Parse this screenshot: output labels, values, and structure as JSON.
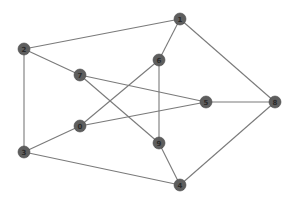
{
  "diagram": {
    "type": "graph",
    "style": {
      "edge_color": "#7a7a7a",
      "node_color": "#5e5e5e",
      "label_color": "#2a2a2a",
      "background": "#ffffff",
      "node_radius": 6
    },
    "nodes": [
      {
        "id": "1",
        "label": "1",
        "x": 180,
        "y": 19
      },
      {
        "id": "2",
        "label": "2",
        "x": 24,
        "y": 49
      },
      {
        "id": "7",
        "label": "7",
        "x": 80,
        "y": 75
      },
      {
        "id": "6",
        "label": "6",
        "x": 159,
        "y": 60
      },
      {
        "id": "5",
        "label": "5",
        "x": 206,
        "y": 102
      },
      {
        "id": "8",
        "label": "8",
        "x": 275,
        "y": 102
      },
      {
        "id": "0",
        "label": "0",
        "x": 80,
        "y": 126
      },
      {
        "id": "3",
        "label": "3",
        "x": 24,
        "y": 152
      },
      {
        "id": "9",
        "label": "9",
        "x": 159,
        "y": 143
      },
      {
        "id": "4",
        "label": "4",
        "x": 180,
        "y": 185
      }
    ],
    "edges": [
      [
        "1",
        "2"
      ],
      [
        "1",
        "6"
      ],
      [
        "1",
        "8"
      ],
      [
        "2",
        "7"
      ],
      [
        "2",
        "3"
      ],
      [
        "7",
        "5"
      ],
      [
        "7",
        "9"
      ],
      [
        "6",
        "0"
      ],
      [
        "6",
        "9"
      ],
      [
        "5",
        "0"
      ],
      [
        "5",
        "8"
      ],
      [
        "0",
        "3"
      ],
      [
        "3",
        "4"
      ],
      [
        "9",
        "4"
      ],
      [
        "8",
        "4"
      ]
    ]
  }
}
